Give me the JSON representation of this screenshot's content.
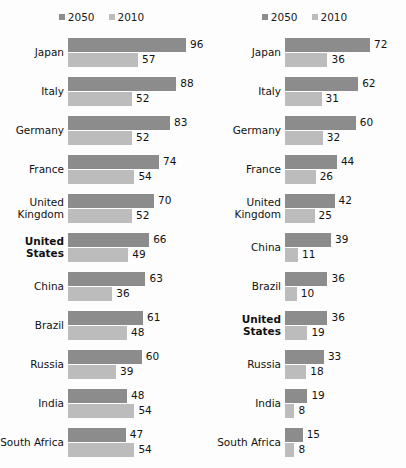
{
  "chart_data": [
    {
      "type": "bar",
      "title": "",
      "subtitle": "",
      "xlabel": "",
      "ylabel": "",
      "orientation": "horizontal",
      "grid": false,
      "legend_position": "top-center",
      "panel": "left",
      "xlim": [
        0,
        100
      ],
      "categories": [
        "Japan",
        "Italy",
        "Germany",
        "France",
        "United Kingdom",
        "United States",
        "China",
        "Brazil",
        "Russia",
        "India",
        "South Africa"
      ],
      "highlight_category": "United States",
      "series": [
        {
          "name": "2050",
          "color": "#8c8c8c",
          "values": [
            96,
            88,
            83,
            74,
            70,
            66,
            63,
            61,
            60,
            48,
            47
          ]
        },
        {
          "name": "2010",
          "color": "#bcbcbc",
          "values": [
            57,
            52,
            52,
            54,
            52,
            49,
            36,
            48,
            39,
            54,
            54
          ]
        }
      ]
    },
    {
      "type": "bar",
      "title": "",
      "subtitle": "",
      "xlabel": "",
      "ylabel": "",
      "orientation": "horizontal",
      "grid": false,
      "legend_position": "top-center",
      "panel": "right",
      "xlim": [
        0,
        80
      ],
      "categories": [
        "Japan",
        "Italy",
        "Germany",
        "France",
        "United Kingdom",
        "China",
        "Brazil",
        "United States",
        "Russia",
        "India",
        "South Africa"
      ],
      "highlight_category": "United States",
      "series": [
        {
          "name": "2050",
          "color": "#8c8c8c",
          "values": [
            72,
            62,
            60,
            44,
            42,
            39,
            36,
            36,
            33,
            19,
            15
          ]
        },
        {
          "name": "2010",
          "color": "#bcbcbc",
          "values": [
            36,
            31,
            32,
            26,
            25,
            11,
            10,
            19,
            18,
            8,
            8
          ]
        }
      ]
    }
  ],
  "left": {
    "legend": [
      {
        "label": "2050",
        "key": "s2050"
      },
      {
        "label": "2010",
        "key": "s2010"
      }
    ],
    "rows": [
      {
        "label": "Japan",
        "bold": false,
        "v2050": "96",
        "v2010": "57"
      },
      {
        "label": "Italy",
        "bold": false,
        "v2050": "88",
        "v2010": "52"
      },
      {
        "label": "Germany",
        "bold": false,
        "v2050": "83",
        "v2010": "52"
      },
      {
        "label": "France",
        "bold": false,
        "v2050": "74",
        "v2010": "54"
      },
      {
        "label": "United Kingdom",
        "bold": false,
        "v2050": "70",
        "v2010": "52"
      },
      {
        "label": "United States",
        "bold": true,
        "v2050": "66",
        "v2010": "49"
      },
      {
        "label": "China",
        "bold": false,
        "v2050": "63",
        "v2010": "36"
      },
      {
        "label": "Brazil",
        "bold": false,
        "v2050": "61",
        "v2010": "48"
      },
      {
        "label": "Russia",
        "bold": false,
        "v2050": "60",
        "v2010": "39"
      },
      {
        "label": "India",
        "bold": false,
        "v2050": "48",
        "v2010": "54"
      },
      {
        "label": "South Africa",
        "bold": false,
        "v2050": "47",
        "v2010": "54"
      }
    ]
  },
  "right": {
    "legend": [
      {
        "label": "2050",
        "key": "s2050"
      },
      {
        "label": "2010",
        "key": "s2010"
      }
    ],
    "rows": [
      {
        "label": "Japan",
        "bold": false,
        "v2050": "72",
        "v2010": "36"
      },
      {
        "label": "Italy",
        "bold": false,
        "v2050": "62",
        "v2010": "31"
      },
      {
        "label": "Germany",
        "bold": false,
        "v2050": "60",
        "v2010": "32"
      },
      {
        "label": "France",
        "bold": false,
        "v2050": "44",
        "v2010": "26"
      },
      {
        "label": "United Kingdom",
        "bold": false,
        "v2050": "42",
        "v2010": "25"
      },
      {
        "label": "China",
        "bold": false,
        "v2050": "39",
        "v2010": "11"
      },
      {
        "label": "Brazil",
        "bold": false,
        "v2050": "36",
        "v2010": "10"
      },
      {
        "label": "United States",
        "bold": true,
        "v2050": "36",
        "v2010": "19"
      },
      {
        "label": "Russia",
        "bold": false,
        "v2050": "33",
        "v2010": "18"
      },
      {
        "label": "India",
        "bold": false,
        "v2050": "19",
        "v2010": "8"
      },
      {
        "label": "South Africa",
        "bold": false,
        "v2050": "15",
        "v2010": "8"
      }
    ]
  },
  "scales": {
    "left_px_per_unit": 1.23,
    "right_px_per_unit": 1.18
  },
  "colors": {
    "series_2050": "#8c8c8c",
    "series_2010": "#bcbcbc",
    "background": "#fdfdfd",
    "text": "#111111"
  }
}
